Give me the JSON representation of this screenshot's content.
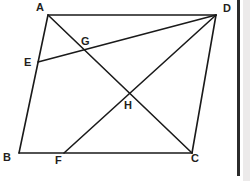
{
  "figure": {
    "width": 250,
    "height": 181,
    "background_color": "#ffffff",
    "stroke_color": "#1a1a1a",
    "label_color": "#231f20",
    "stroke_width": 1.6
  },
  "points": {
    "A": {
      "label": "A",
      "x": 48,
      "y": 15,
      "label_x": 36,
      "label_y": 2
    },
    "B": {
      "label": "B",
      "x": 19,
      "y": 153,
      "label_x": 3,
      "label_y": 152
    },
    "C": {
      "label": "C",
      "x": 192,
      "y": 153,
      "label_x": 191,
      "label_y": 153
    },
    "D": {
      "label": "D",
      "x": 216,
      "y": 15,
      "label_x": 223,
      "label_y": 3
    },
    "E": {
      "label": "E",
      "x": 38,
      "y": 62,
      "label_x": 24,
      "label_y": 57
    },
    "F": {
      "label": "F",
      "x": 64,
      "y": 153,
      "label_x": 55,
      "label_y": 155
    },
    "G": {
      "label": "G",
      "x": 86,
      "y": 52,
      "label_x": 81,
      "label_y": 36
    },
    "H": {
      "label": "H",
      "x": 129,
      "y": 97,
      "label_x": 124,
      "label_y": 100
    }
  },
  "segments": [
    {
      "name": "side-AD",
      "from": "A",
      "to": "D",
      "kind": "edge"
    },
    {
      "name": "side-AB",
      "from": "A",
      "to": "B",
      "kind": "edge"
    },
    {
      "name": "side-BC",
      "from": "B",
      "to": "C",
      "kind": "edge"
    },
    {
      "name": "side-DC",
      "from": "D",
      "to": "C",
      "kind": "edge"
    },
    {
      "name": "diagonal-AC",
      "from": "A",
      "to": "C",
      "kind": "cevian"
    },
    {
      "name": "cevian-ED",
      "from": "E",
      "to": "D",
      "kind": "cevian"
    },
    {
      "name": "cevian-FD",
      "from": "F",
      "to": "D",
      "kind": "cevian"
    }
  ],
  "right_rule": {
    "name": "vertical-rule",
    "x": 237,
    "y": 0,
    "height": 176,
    "color": "#2b2b2b"
  },
  "right_panel": {
    "name": "right-margin-panel",
    "x": 243,
    "width": 7,
    "color": "#eceaea"
  }
}
